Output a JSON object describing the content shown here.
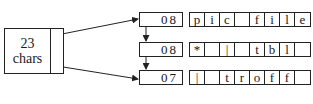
{
  "header_box": {
    "line1": "23",
    "line2": "chars"
  },
  "rows": [
    {
      "count": "08",
      "cells": [
        "p",
        "i",
        "c",
        " ",
        "f",
        "i",
        "l",
        "e"
      ]
    },
    {
      "count": "08",
      "cells": [
        "*",
        " ",
        "|",
        " ",
        "t",
        "b",
        "l",
        " "
      ]
    },
    {
      "count": "07",
      "cells": [
        "|",
        " ",
        "t",
        "r",
        "o",
        "f",
        "f",
        " "
      ]
    }
  ]
}
